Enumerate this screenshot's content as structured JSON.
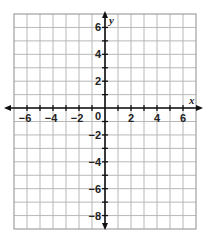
{
  "chart_data": {
    "type": "scatter",
    "title": "",
    "xlabel": "x",
    "ylabel": "y",
    "xlim": [
      -7,
      7
    ],
    "ylim": [
      -9,
      7
    ],
    "grid": true,
    "grid_step": 1,
    "x_tick_labels": [
      "−6",
      "−4",
      "−2",
      "2",
      "4",
      "6"
    ],
    "x_tick_values": [
      -6,
      -4,
      -2,
      2,
      4,
      6
    ],
    "y_tick_labels": [
      "6",
      "4",
      "2",
      "−2",
      "−4",
      "−6",
      "−8"
    ],
    "y_tick_values": [
      6,
      4,
      2,
      -2,
      -4,
      -6,
      -8
    ],
    "origin_label": "0",
    "series": [],
    "colors": {
      "grid": "#b8b8b8",
      "border": "#a0a0a0",
      "axis": "#111111",
      "text": "#222222"
    }
  }
}
